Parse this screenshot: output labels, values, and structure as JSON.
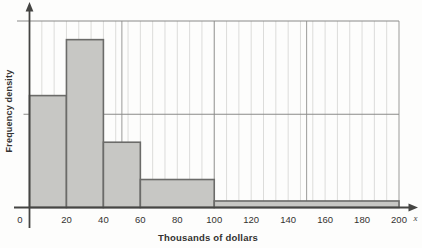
{
  "chart": {
    "ylabel": "Frequency density",
    "xlabel": "Thousands of dollars",
    "x_var_label": "x",
    "origin_label": "0"
  },
  "chart_data": {
    "type": "bar",
    "subtype": "histogram",
    "title": "",
    "xlabel": "Thousands of dollars",
    "ylabel": "Frequency density",
    "xlim": [
      0,
      200
    ],
    "ylim": [
      0,
      2
    ],
    "x_tick_values": [
      20,
      40,
      60,
      80,
      100,
      120,
      140,
      160,
      180,
      200
    ],
    "x_tick_labels": [
      "20",
      "40",
      "60",
      "80",
      "100",
      "120",
      "140",
      "160",
      "180",
      "200"
    ],
    "y_tick_labels_shown": false,
    "bins": [
      {
        "x_start": 0,
        "x_end": 20,
        "frequency_density": 1.2
      },
      {
        "x_start": 20,
        "x_end": 40,
        "frequency_density": 1.8
      },
      {
        "x_start": 40,
        "x_end": 60,
        "frequency_density": 0.7
      },
      {
        "x_start": 60,
        "x_end": 100,
        "frequency_density": 0.3
      },
      {
        "x_start": 100,
        "x_end": 200,
        "frequency_density": 0.07
      }
    ],
    "y_gridlines_at_density": [
      1,
      2
    ],
    "x_major_gridlines_at": [
      50,
      100,
      150,
      200
    ],
    "minor_vertical_rule_count": 29,
    "grid_style": "graph-paper: fine vertical rules with darker rules every 50 units; horizontal rules at density 1 and 2",
    "legend": "none",
    "axis_arrows": [
      "up on y-axis",
      "right on x-axis"
    ]
  },
  "colors": {
    "background": "#fdfdfc",
    "bar_fill": "#c7c7c4",
    "bar_border": "#6b6b69",
    "axis": "#454543",
    "gridline_horizontal": "#8a8a88",
    "gridline_major_vertical": "#9b9b99",
    "gridline_fine_vertical": "#dcdcda",
    "text": "#333230"
  }
}
